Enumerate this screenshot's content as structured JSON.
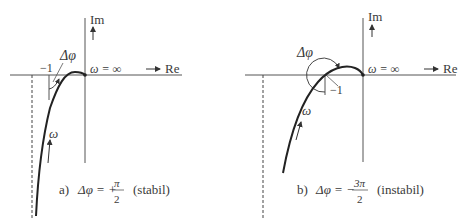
{
  "figure_a": {
    "axis_im": "Im",
    "axis_re": "Re",
    "omega_inf": "ω = ∞",
    "minus_one": "−1",
    "delta_phi": "Δφ",
    "omega": "ω",
    "caption_label": "a)",
    "caption_lhs": "Δφ = +",
    "caption_num": "π",
    "caption_den": "2",
    "caption_note": "(stabil)"
  },
  "figure_b": {
    "axis_im": "Im",
    "axis_re": "Re",
    "omega_inf": "ω = ∞",
    "minus_one": "−1",
    "delta_phi": "Δφ",
    "omega": "ω",
    "caption_label": "b)",
    "caption_lhs": "Δφ = −",
    "caption_num": "3π",
    "caption_den": "2",
    "caption_note": "(instabil)"
  },
  "colors": {
    "curve": "#2a2a2a",
    "axis": "#555555",
    "text": "#3a3a3a"
  }
}
